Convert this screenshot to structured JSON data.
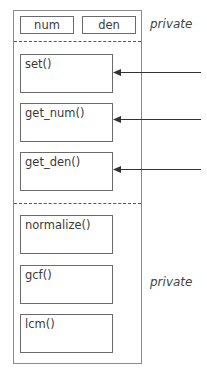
{
  "fields": [
    {
      "label": "num"
    },
    {
      "label": "den"
    }
  ],
  "access_labels": {
    "top": "private",
    "bottom": "private"
  },
  "public_methods": [
    {
      "label": "set()"
    },
    {
      "label": "get_num()"
    },
    {
      "label": "get_den()"
    }
  ],
  "private_methods": [
    {
      "label": "normalize()"
    },
    {
      "label": "gcf()"
    },
    {
      "label": "lcm()"
    }
  ],
  "colors": {
    "stroke": "#6a6a6a",
    "text": "#3a3a3a"
  }
}
